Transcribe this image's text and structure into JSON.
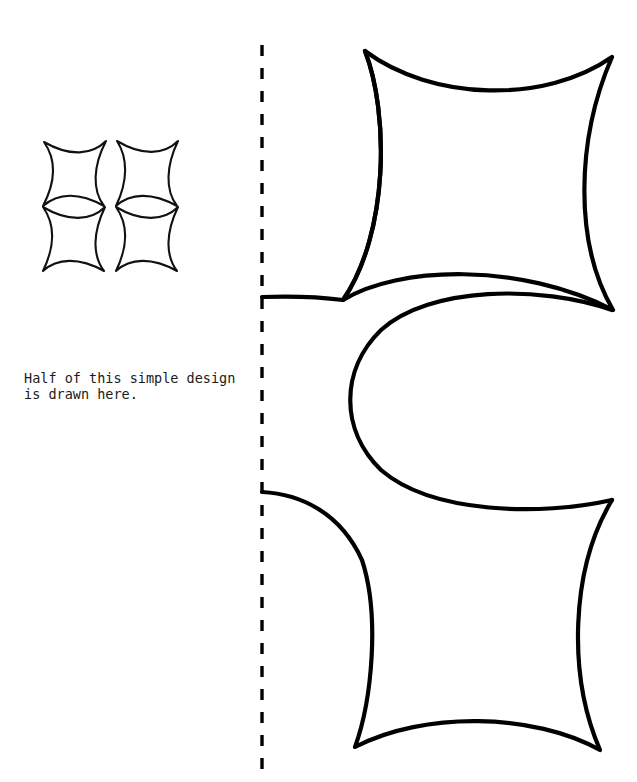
{
  "page": {
    "background_color": "#ffffff",
    "width": 637,
    "height": 782
  },
  "instruction": {
    "line1": "Half of this simple design",
    "line2": "is drawn here.",
    "full_text": "Half of this simple design\nis drawn here.",
    "color": "#1a1a1a",
    "font_size_px": 13.5
  },
  "fold_line": {
    "name": "fold-line",
    "orientation": "vertical",
    "x": 262,
    "y_start": 45,
    "y_end": 772,
    "stroke_color": "#000000",
    "stroke_width": 3.4,
    "dash": 11,
    "gap": 12
  },
  "thumbnail_design": {
    "name": "complete-design-thumbnail",
    "description": "Small complete version of the design: four concave-square (astroid) tiles arranged 2x2 with curved negative space forming a cross",
    "bounds": {
      "x": 40,
      "y": 139,
      "width": 142,
      "height": 133
    },
    "stroke_color": "#111111",
    "stroke_width": 2.1,
    "fill": "none",
    "tile_count": 4
  },
  "large_design": {
    "name": "half-design-large",
    "description": "Large half of the design drawn to the right of the fold line: concave-square shape at top, open C shape in the middle, concave-square shape at bottom",
    "stroke_color": "#000000",
    "stroke_width": 4.2,
    "fill": "none",
    "shapes": [
      {
        "name": "top-concave-square",
        "cusps": [
          [
            365,
            51
          ],
          [
            612,
            57
          ],
          [
            613,
            310
          ],
          [
            262,
            297
          ]
        ]
      },
      {
        "name": "middle-c-shape",
        "cusps": [
          [
            612,
            310
          ],
          [
            356,
            398
          ],
          [
            612,
            500
          ]
        ],
        "left_extent_x": 356,
        "top_y": 285,
        "bottom_y": 512
      },
      {
        "name": "bottom-concave-square",
        "cusps": [
          [
            262,
            492
          ],
          [
            612,
            500
          ],
          [
            600,
            750
          ],
          [
            355,
            747
          ]
        ]
      }
    ]
  }
}
